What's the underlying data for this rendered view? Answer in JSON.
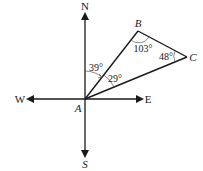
{
  "diagram": {
    "type": "compass-bearing-triangle",
    "compass": {
      "north": "N",
      "south": "S",
      "east": "E",
      "west": "W"
    },
    "points": {
      "A": "A",
      "B": "B",
      "C": "C"
    },
    "angles": {
      "north_to_AB": "39°",
      "BAC": "29°",
      "ABC": "103°",
      "BCA": "48°"
    },
    "colors": {
      "stroke": "#1a1a1a",
      "background": "#ffffff"
    }
  }
}
